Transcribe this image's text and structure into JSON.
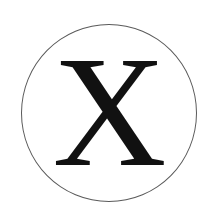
{
  "badge": {
    "letter": "X",
    "icon": "circled-letter-icon",
    "colors": {
      "background": "#ffffff",
      "circle_stroke": "#5a5a5a",
      "letter": "#111111"
    }
  }
}
